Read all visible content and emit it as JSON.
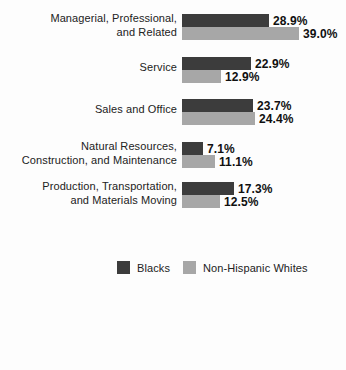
{
  "chart_data": {
    "type": "bar",
    "orientation": "horizontal",
    "unit": "%",
    "title": "",
    "xlabel": "",
    "ylabel": "",
    "axis": "none",
    "grid": false,
    "legend_position": "bottom",
    "background": "#fdfdfd",
    "categories": [
      "Managerial, Professional, and Related",
      "Service",
      "Sales and Office",
      "Natural Resources, Construction, and Maintenance",
      "Production, Transportation, and Materials Moving"
    ],
    "category_label_lines": [
      [
        "Managerial, Professional,",
        "and Related"
      ],
      [
        "Service"
      ],
      [
        "Sales and Office"
      ],
      [
        "Natural Resources,",
        "Construction, and Maintenance"
      ],
      [
        "Production, Transportation,",
        "and Materials Moving"
      ]
    ],
    "series": [
      {
        "name": "Blacks",
        "color": "#3c3c3c",
        "values": [
          28.9,
          22.9,
          23.7,
          7.1,
          17.3
        ]
      },
      {
        "name": "Non-Hispanic Whites",
        "color": "#a7a7a7",
        "values": [
          39.0,
          12.9,
          24.4,
          11.1,
          12.5
        ]
      }
    ],
    "value_labels": [
      [
        "28.9%",
        "39.0%"
      ],
      [
        "22.9%",
        "12.9%"
      ],
      [
        "23.7%",
        "24.4%"
      ],
      [
        "7.1%",
        "11.1%"
      ],
      [
        "17.3%",
        "12.5%"
      ]
    ]
  }
}
